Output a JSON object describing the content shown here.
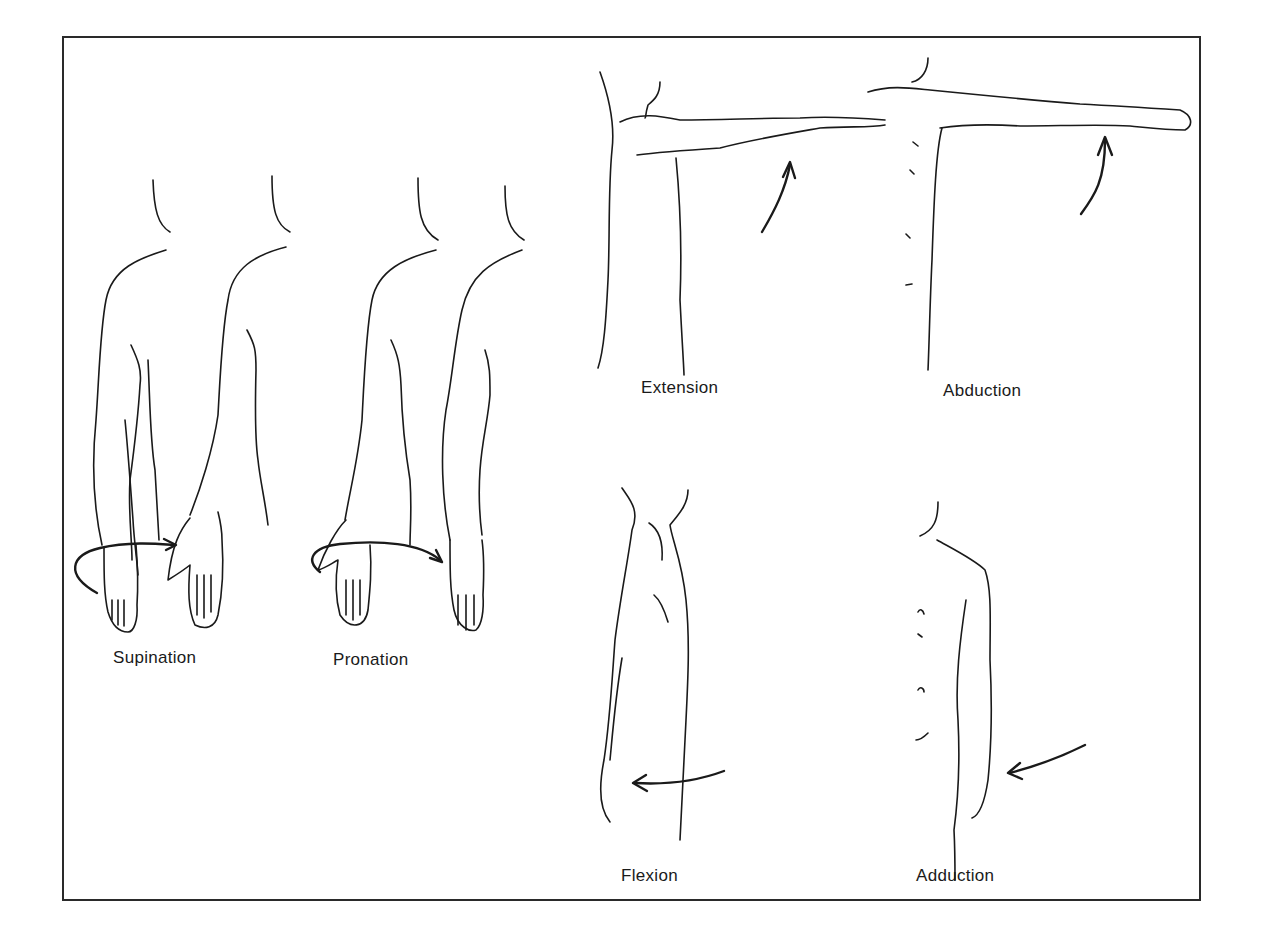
{
  "figure": {
    "panels": [
      {
        "id": "supination",
        "label": "Supination",
        "x": 113,
        "y": 648
      },
      {
        "id": "pronation",
        "label": "Pronation",
        "x": 333,
        "y": 650
      },
      {
        "id": "extension",
        "label": "Extension",
        "x": 641,
        "y": 378
      },
      {
        "id": "abduction",
        "label": "Abduction",
        "x": 943,
        "y": 381
      },
      {
        "id": "flexion",
        "label": "Flexion",
        "x": 621,
        "y": 866
      },
      {
        "id": "adduction",
        "label": "Adduction",
        "x": 916,
        "y": 866
      }
    ]
  }
}
